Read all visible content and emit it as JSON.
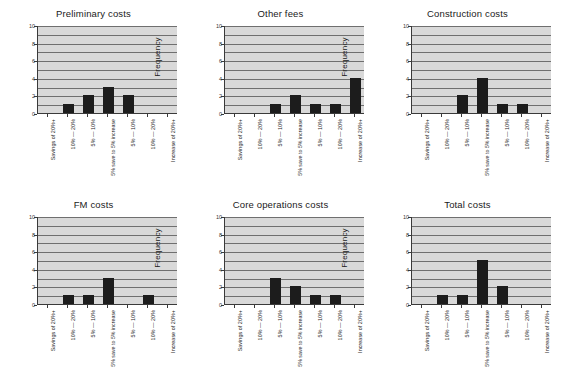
{
  "figure": {
    "background": "#ffffff",
    "plot_background": "#d9d9d9",
    "bar_color": "#1c1c1c",
    "gridline_color": "#6f6f6f",
    "axis_color": "#3a3a3a",
    "rows": 2,
    "cols": 3
  },
  "categories": [
    "Savings of 20%+",
    "10% — 20%",
    "5% — 10%",
    "5% save to 5% increase",
    "5% — 10%",
    "10% — 20%",
    "Increase of 20%+"
  ],
  "yticks": [
    "0",
    "2",
    "4",
    "6",
    "8",
    "10"
  ],
  "ylabel": "Frequency",
  "chart_data": [
    {
      "type": "bar",
      "title": "Preliminary costs",
      "xlabel": "",
      "ylabel": "Frequency",
      "ylim": [
        0,
        10
      ],
      "grid": true,
      "legend": "none",
      "categories": [
        "Savings of 20%+",
        "10% — 20%",
        "5% — 10%",
        "5% save to 5% increase",
        "5% — 10%",
        "10% — 20%",
        "Increase of 20%+"
      ],
      "values": [
        0,
        1,
        2,
        3,
        2,
        0,
        0
      ]
    },
    {
      "type": "bar",
      "title": "Other fees",
      "xlabel": "",
      "ylabel": "Frequency",
      "ylim": [
        0,
        10
      ],
      "grid": true,
      "legend": "none",
      "categories": [
        "Savings of 20%+",
        "10% — 20%",
        "5% — 10%",
        "5% save to 5% increase",
        "5% — 10%",
        "10% — 20%",
        "Increase of 20%+"
      ],
      "values": [
        0,
        0,
        1,
        2,
        1,
        1,
        4
      ]
    },
    {
      "type": "bar",
      "title": "Construction costs",
      "xlabel": "",
      "ylabel": "Frequency",
      "ylim": [
        0,
        10
      ],
      "grid": true,
      "legend": "none",
      "categories": [
        "Savings of 20%+",
        "10% — 20%",
        "5% — 10%",
        "5% save to 5% increase",
        "5% — 10%",
        "10% — 20%",
        "Increase of 20%+"
      ],
      "values": [
        0,
        0,
        2,
        4,
        1,
        1,
        0
      ]
    },
    {
      "type": "bar",
      "title": "FM costs",
      "xlabel": "",
      "ylabel": "Frequency",
      "ylim": [
        0,
        10
      ],
      "grid": true,
      "legend": "none",
      "categories": [
        "Savings of 20%+",
        "10% — 20%",
        "5% — 10%",
        "5% save to 5% increase",
        "5% — 10%",
        "10% — 20%",
        "Increase of 20%+"
      ],
      "values": [
        0,
        1,
        1,
        3,
        0,
        1,
        0
      ]
    },
    {
      "type": "bar",
      "title": "Core operations costs",
      "xlabel": "",
      "ylabel": "Frequency",
      "ylim": [
        0,
        10
      ],
      "grid": true,
      "legend": "none",
      "categories": [
        "Savings of 20%+",
        "10% — 20%",
        "5% — 10%",
        "5% save to 5% increase",
        "5% — 10%",
        "10% — 20%",
        "Increase of 20%+"
      ],
      "values": [
        0,
        0,
        3,
        2,
        1,
        1,
        0
      ]
    },
    {
      "type": "bar",
      "title": "Total costs",
      "xlabel": "",
      "ylabel": "Frequency",
      "ylim": [
        0,
        10
      ],
      "grid": true,
      "legend": "none",
      "categories": [
        "Savings of 20%+",
        "10% — 20%",
        "5% — 10%",
        "5% save to 5% increase",
        "5% — 10%",
        "10% — 20%",
        "Increase of 20%+"
      ],
      "values": [
        0,
        1,
        1,
        5,
        2,
        0,
        0
      ]
    }
  ]
}
